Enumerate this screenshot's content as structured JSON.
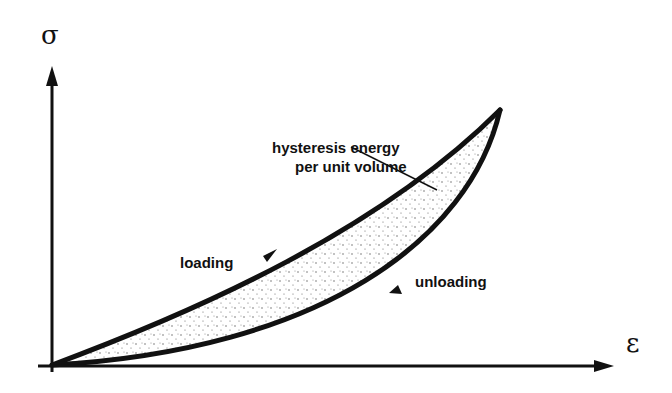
{
  "diagram": {
    "y_axis_label": "σ",
    "x_axis_label": "ε",
    "annotation_line1": "hysteresis energy",
    "annotation_line2": "per unit volume",
    "loading_label": "loading",
    "unloading_label": "unloading",
    "colors": {
      "stroke": "#111111",
      "background": "#ffffff",
      "stipple": "#555555"
    }
  }
}
